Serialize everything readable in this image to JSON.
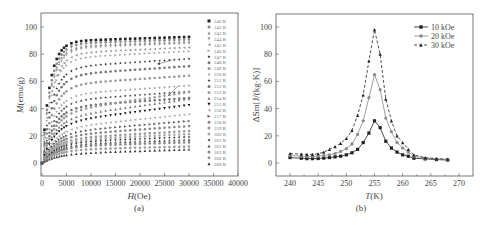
{
  "chart_data": [
    {
      "id": "a",
      "type": "scatter",
      "panel_label": "(a)",
      "title": "",
      "xlabel": "H(Oe)",
      "ylabel": "M(emu/g)",
      "xlim": [
        0,
        40000
      ],
      "ylim": [
        -10,
        110
      ],
      "xticks": [
        0,
        5000,
        10000,
        15000,
        20000,
        25000,
        30000,
        35000,
        40000
      ],
      "yticks": [
        0,
        20,
        40,
        60,
        80,
        100
      ],
      "grid": false,
      "legend_position": "right",
      "x": [
        0,
        500,
        1000,
        1500,
        2000,
        2500,
        3000,
        3500,
        4000,
        4500,
        5000,
        6000,
        7000,
        8000,
        9000,
        10000,
        11000,
        12000,
        13000,
        14000,
        15000,
        16000,
        17000,
        18000,
        19000,
        20000,
        21000,
        22000,
        23000,
        24000,
        25000,
        26000,
        27000,
        28000,
        29000,
        30000
      ],
      "series": [
        {
          "name": "240 K",
          "marker": "square",
          "color": "#222222",
          "m_sat": 97,
          "h_knee": 2500,
          "slope": 8e-05
        },
        {
          "name": "242 K",
          "marker": "circle",
          "color": "#888888",
          "m_sat": 95,
          "h_knee": 2700,
          "slope": 8e-05
        },
        {
          "name": "243 K",
          "marker": "triangle-up",
          "color": "#888888",
          "m_sat": 94,
          "h_knee": 2800,
          "slope": 9e-05
        },
        {
          "name": "244 K",
          "marker": "triangle-down",
          "color": "#999999",
          "m_sat": 93,
          "h_knee": 2900,
          "slope": 0.0001
        },
        {
          "name": "245 K",
          "marker": "triangle-left",
          "color": "#999999",
          "m_sat": 91,
          "h_knee": 3000,
          "slope": 0.00012
        },
        {
          "name": "246 K",
          "marker": "triangle-right",
          "color": "#aaaaaa",
          "m_sat": 89,
          "h_knee": 3100,
          "slope": 0.00014
        },
        {
          "name": "247 K",
          "marker": "star",
          "color": "#222222",
          "m_sat": 85,
          "h_knee": 3200,
          "slope": 0.00018
        },
        {
          "name": "248 K",
          "marker": "circle",
          "color": "#777777",
          "m_sat": 80,
          "h_knee": 3300,
          "slope": 0.0002
        },
        {
          "name": "249 K",
          "marker": "circle",
          "color": "#999999",
          "m_sat": 73,
          "h_knee": 3400,
          "slope": 0.00022
        },
        {
          "name": "250 K",
          "marker": "diamond",
          "color": "#aaaaaa",
          "m_sat": 66,
          "h_knee": 3500,
          "slope": 0.00025
        },
        {
          "name": "251 K",
          "marker": "star",
          "color": "#333333",
          "m_sat": 60,
          "h_knee": 3600,
          "slope": 0.00028
        },
        {
          "name": "252 K",
          "marker": "circle",
          "color": "#777777",
          "m_sat": 54,
          "h_knee": 3700,
          "slope": 0.0003
        },
        {
          "name": "253 K",
          "marker": "circle",
          "color": "#999999",
          "m_sat": 48,
          "h_knee": 3800,
          "slope": 0.00032
        },
        {
          "name": "254 K",
          "marker": "triangle-up",
          "color": "#777777",
          "m_sat": 43,
          "h_knee": 3900,
          "slope": 0.00033
        },
        {
          "name": "255 K",
          "marker": "triangle-down",
          "color": "#111111",
          "m_sat": 38,
          "h_knee": 4000,
          "slope": 0.00035
        },
        {
          "name": "256 K",
          "marker": "triangle-left",
          "color": "#aaaaaa",
          "m_sat": 33,
          "h_knee": 4100,
          "slope": 0.00032
        },
        {
          "name": "257 K",
          "marker": "triangle-right",
          "color": "#555555",
          "m_sat": 29,
          "h_knee": 4200,
          "slope": 0.0003
        },
        {
          "name": "258 K",
          "marker": "circle",
          "color": "#888888",
          "m_sat": 26,
          "h_knee": 4300,
          "slope": 0.00028
        },
        {
          "name": "259 K",
          "marker": "circle",
          "color": "#999999",
          "m_sat": 23,
          "h_knee": 4400,
          "slope": 0.00026
        },
        {
          "name": "260 K",
          "marker": "circle",
          "color": "#aaaaaa",
          "m_sat": 21,
          "h_knee": 4500,
          "slope": 0.00024
        },
        {
          "name": "261 K",
          "marker": "star",
          "color": "#222222",
          "m_sat": 19,
          "h_knee": 4600,
          "slope": 0.00022
        },
        {
          "name": "262 K",
          "marker": "triangle-up",
          "color": "#555555",
          "m_sat": 17,
          "h_knee": 4700,
          "slope": 0.0002
        },
        {
          "name": "263 K",
          "marker": "circle",
          "color": "#888888",
          "m_sat": 15,
          "h_knee": 4800,
          "slope": 0.0002
        },
        {
          "name": "266 K",
          "marker": "circle",
          "color": "#999999",
          "m_sat": 12,
          "h_knee": 4900,
          "slope": 0.0002
        },
        {
          "name": "268 K",
          "marker": "triangle-up",
          "color": "#333333",
          "m_sat": 9,
          "h_knee": 5000,
          "slope": 0.00035
        }
      ]
    },
    {
      "id": "b",
      "type": "line",
      "panel_label": "(b)",
      "title": "",
      "xlabel": "T(K)",
      "ylabel": "ΔSm[J/(kg·K)]",
      "xlim": [
        238,
        272
      ],
      "ylim": [
        -10,
        110
      ],
      "xticks": [
        240,
        245,
        250,
        255,
        260,
        265,
        270
      ],
      "yticks": [
        0,
        20,
        40,
        60,
        80,
        100
      ],
      "grid": false,
      "legend_position": "top-right",
      "x": [
        240,
        242,
        243,
        244,
        245,
        246,
        247,
        248,
        249,
        250,
        251,
        252,
        253,
        254,
        255,
        256,
        257,
        258,
        259,
        260,
        261,
        262,
        264,
        266,
        268
      ],
      "series": [
        {
          "name": "10 kOe",
          "marker": "square",
          "color": "#222222",
          "dash": "solid",
          "values": [
            4,
            3.5,
            3.2,
            3.2,
            3.3,
            3.6,
            4,
            4.5,
            5,
            6,
            7.5,
            10,
            15,
            22,
            31,
            26,
            16,
            11,
            8,
            6,
            5,
            3.5,
            3,
            2.5,
            2.2
          ]
        },
        {
          "name": "20 kOe",
          "marker": "circle",
          "color": "#888888",
          "dash": "solid",
          "values": [
            5.5,
            5,
            4.8,
            4.8,
            5,
            5.5,
            6,
            7,
            8.5,
            10.5,
            14,
            21,
            31,
            48,
            65,
            54,
            33,
            23,
            15,
            11,
            8,
            5,
            3.5,
            3,
            2.5
          ]
        },
        {
          "name": "30 kOe",
          "marker": "triangle-up",
          "color": "#222222",
          "dash": "dashed",
          "values": [
            7,
            6.5,
            6.3,
            6.3,
            6.8,
            8,
            10,
            12,
            14.5,
            18,
            24,
            35,
            50,
            75,
            98,
            80,
            47,
            31,
            20,
            15,
            10,
            6,
            4,
            3.2,
            2.8
          ]
        }
      ]
    }
  ],
  "annotations": {
    "left_panel_arrows": 2
  }
}
